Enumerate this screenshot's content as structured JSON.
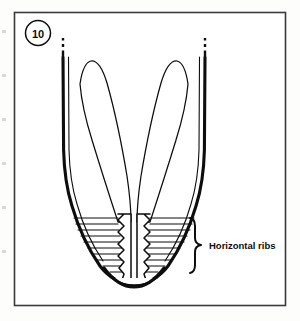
{
  "figure": {
    "number": "10",
    "frame": {
      "x": 14,
      "y": 12,
      "width": 272,
      "height": 294,
      "border_color": "#3a3a3a",
      "background": "#ffffff"
    },
    "badge": {
      "label": "10",
      "center_x": 38,
      "center_y": 33,
      "radius": 13,
      "icon": "circled-number-badge"
    },
    "annotations": [
      {
        "name": "horizontal-ribs",
        "text": "Horizontal ribs",
        "text_x": 209,
        "text_y": 248,
        "brace": {
          "icon": "curly-brace-right",
          "x": 188,
          "y_top": 217,
          "y_bottom": 273,
          "tip_x": 203,
          "tip_y": 245
        }
      }
    ],
    "drawing": {
      "name": "mandible-incisor-roots-diagram",
      "stroke_color": "#0d0d0d",
      "fill_color": "#ffffff",
      "left_stem": {
        "x": 63,
        "y_top": 58,
        "y_bottom": 215,
        "break_marks_y": [
          40,
          46,
          52
        ]
      },
      "right_stem": {
        "x": 205,
        "y_top": 58,
        "y_bottom": 215,
        "break_marks_y": [
          40,
          46,
          52
        ]
      },
      "left_blade": {
        "tip_x": 89,
        "tip_y": 61,
        "base_y": 222
      },
      "right_blade": {
        "tip_x": 180,
        "tip_y": 61,
        "base_y": 222
      },
      "outer_rib_count": 9,
      "inner_zigzag_count": 8,
      "tip_center_x": 134,
      "tip_bottom_y": 287
    }
  },
  "scan_artifacts": {
    "left_margin_marks": [
      {
        "x": 2,
        "y": 30,
        "height": 3
      },
      {
        "x": 2,
        "y": 74,
        "height": 3
      },
      {
        "x": 2,
        "y": 118,
        "height": 3
      },
      {
        "x": 2,
        "y": 162,
        "height": 3
      },
      {
        "x": 2,
        "y": 206,
        "height": 3
      },
      {
        "x": 2,
        "y": 250,
        "height": 3
      }
    ],
    "color": "#d8d8d8"
  }
}
